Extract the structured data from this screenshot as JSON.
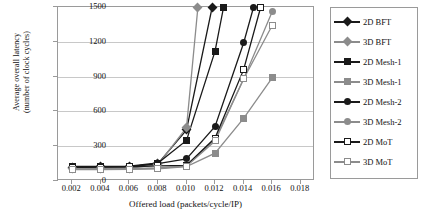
{
  "chart_data": {
    "type": "line",
    "title": "",
    "xlabel": "Offered load (packets/cycle/IP)",
    "ylabel": "Average overall latency (number of clock cycles)",
    "ylabel_line1": "Average overall latency",
    "ylabel_line2": "(number of clock cycles)",
    "x": [
      0.002,
      0.004,
      0.006,
      0.008,
      0.01,
      0.012,
      0.014,
      0.016
    ],
    "xlim": [
      0.001,
      0.019
    ],
    "ylim": [
      0,
      1500
    ],
    "xticks": [
      "0.002",
      "0.004",
      "0.006",
      "0.008",
      "0.010",
      "0.012",
      "0.014",
      "0.016",
      "0.018"
    ],
    "xtick_values": [
      0.002,
      0.004,
      0.006,
      0.008,
      0.01,
      0.012,
      0.014,
      0.016,
      0.018
    ],
    "yticks": [
      "0",
      "300",
      "600",
      "900",
      "1200",
      "1500"
    ],
    "ytick_values": [
      0,
      300,
      600,
      900,
      1200,
      1500
    ],
    "grid": "horizontal",
    "legend_position": "right",
    "colors": {
      "series_2d": "#1a1a1a",
      "series_3d": "#8c8c8c",
      "gridline": "#c8c8c8",
      "axis": "#9a9a9a",
      "background": "#ffffff"
    },
    "series": [
      {
        "name": "2D BFT",
        "color": "#1a1a1a",
        "marker": "diamond",
        "filled": true,
        "x": [
          0.002,
          0.004,
          0.006,
          0.008,
          0.01,
          0.0118
        ],
        "values": [
          120,
          122,
          124,
          150,
          440,
          1500
        ]
      },
      {
        "name": "3D BFT",
        "color": "#8c8c8c",
        "marker": "diamond",
        "filled": true,
        "x": [
          0.002,
          0.004,
          0.006,
          0.008,
          0.01,
          0.0108
        ],
        "values": [
          105,
          106,
          108,
          140,
          460,
          1500
        ]
      },
      {
        "name": "2D Mesh-1",
        "color": "#1a1a1a",
        "marker": "square",
        "filled": true,
        "x": [
          0.002,
          0.004,
          0.006,
          0.008,
          0.01,
          0.012,
          0.0126
        ],
        "values": [
          125,
          126,
          128,
          155,
          350,
          1120,
          1500
        ]
      },
      {
        "name": "3D Mesh-1",
        "color": "#8c8c8c",
        "marker": "square",
        "filled": true,
        "x": [
          0.002,
          0.004,
          0.006,
          0.008,
          0.01,
          0.012,
          0.014,
          0.016
        ],
        "values": [
          98,
          99,
          100,
          105,
          125,
          240,
          540,
          890
        ]
      },
      {
        "name": "2D Mesh-2",
        "color": "#1a1a1a",
        "marker": "circle",
        "filled": true,
        "x": [
          0.002,
          0.004,
          0.006,
          0.008,
          0.01,
          0.012,
          0.014,
          0.0147
        ],
        "values": [
          120,
          121,
          123,
          150,
          190,
          470,
          1190,
          1500
        ]
      },
      {
        "name": "3D Mesh-2",
        "color": "#8c8c8c",
        "marker": "circle",
        "filled": true,
        "x": [
          0.002,
          0.004,
          0.006,
          0.008,
          0.01,
          0.012,
          0.014,
          0.016
        ],
        "values": [
          103,
          104,
          106,
          112,
          130,
          360,
          880,
          1460
        ]
      },
      {
        "name": "2D MoT",
        "color": "#1a1a1a",
        "marker": "hollow-square",
        "filled": false,
        "x": [
          0.002,
          0.004,
          0.006,
          0.008,
          0.01,
          0.012,
          0.014,
          0.0152
        ],
        "values": [
          118,
          119,
          121,
          130,
          135,
          370,
          960,
          1500
        ]
      },
      {
        "name": "3D MoT",
        "color": "#8c8c8c",
        "marker": "hollow-square",
        "filled": false,
        "x": [
          0.002,
          0.004,
          0.006,
          0.008,
          0.01,
          0.012,
          0.014,
          0.016
        ],
        "values": [
          100,
          101,
          103,
          110,
          128,
          345,
          880,
          1340
        ]
      }
    ]
  }
}
